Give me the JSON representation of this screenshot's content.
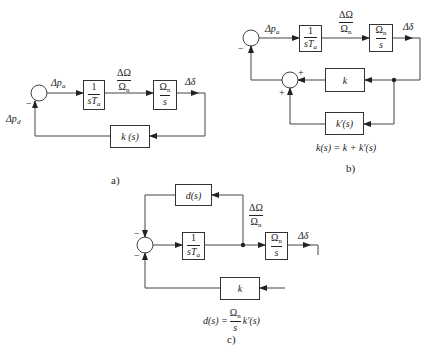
{
  "diagram_a": {
    "input_label": "Δp",
    "input_sub": "a",
    "feedback_label": "Δp",
    "feedback_sub": "d",
    "sum_sign": "−",
    "block1": {
      "num": "1",
      "den": "sT",
      "den_sub": "a"
    },
    "mid_label": {
      "num": "ΔΩ",
      "den": "Ω",
      "den_sub": "n"
    },
    "block2": {
      "num": "Ω",
      "num_sub": "n",
      "den": "s"
    },
    "output_label": "Δδ",
    "feedback_block": "k (s)",
    "caption": "a)"
  },
  "diagram_b": {
    "input_label": "Δp",
    "input_sub": "a",
    "sum_sign": "−",
    "inner_sum_signs": [
      "+",
      "+"
    ],
    "block1": {
      "num": "1",
      "den": "sT",
      "den_sub": "a"
    },
    "mid_label": {
      "num": "ΔΩ",
      "den": "Ω",
      "den_sub": "n"
    },
    "block2": {
      "num": "Ω",
      "num_sub": "n",
      "den": "s"
    },
    "output_label": "Δδ",
    "feedback_block_k": "k",
    "feedback_block_kprime": "k′(s)",
    "equation": "k(s) = k + k′(s)",
    "caption": "b)"
  },
  "diagram_c": {
    "sum_signs": [
      "−",
      "−"
    ],
    "block_d": "d(s)",
    "block1": {
      "num": "1",
      "den": "sT",
      "den_sub": "a"
    },
    "mid_label": {
      "num": "ΔΩ",
      "den": "Ω",
      "den_sub": "n"
    },
    "block2": {
      "num": "Ω",
      "num_sub": "n",
      "den": "s"
    },
    "output_label": "Δδ",
    "feedback_block_k": "k",
    "equation_lhs": "d(s) =",
    "equation_frac": {
      "num": "Ω",
      "num_sub": "n",
      "den": "s"
    },
    "equation_rhs": "k′(s)",
    "caption": "c)"
  }
}
